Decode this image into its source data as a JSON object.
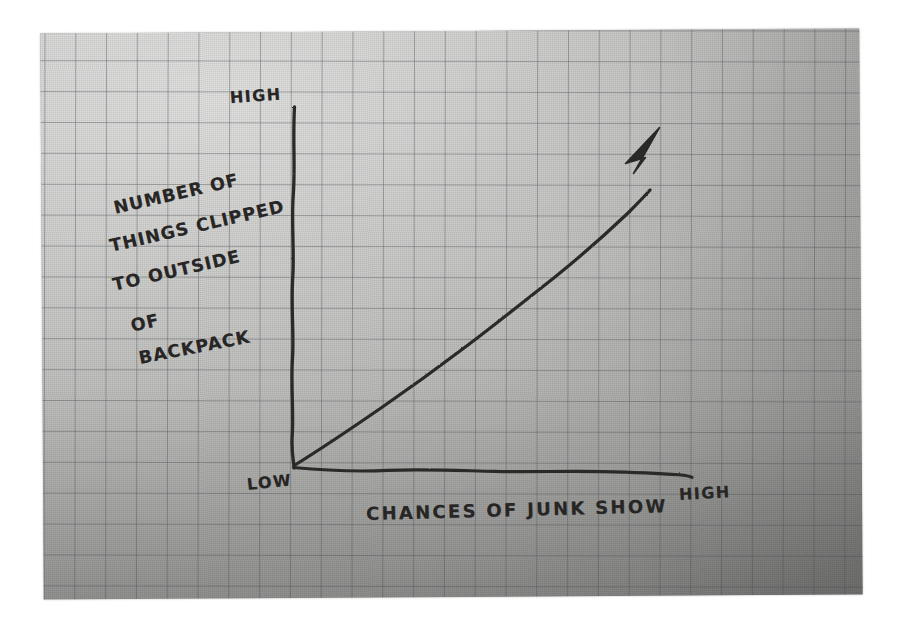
{
  "chart_data": {
    "type": "line",
    "title": "",
    "subtitle": "",
    "medium": "hand-drawn pen sketch on grey graph paper",
    "xlabel": "CHANCES OF JUNK SHOW",
    "ylabel": "NUMBER OF THINGS CLIPPED TO OUTSIDE OF BACKPACK",
    "ylabel_lines": [
      "NUMBER OF",
      "THINGS CLIPPED",
      "TO OUTSIDE",
      "OF",
      "BACKPACK"
    ],
    "x_tick_labels": [
      "LOW",
      "HIGH"
    ],
    "y_tick_labels": [
      "LOW",
      "HIGH"
    ],
    "origin_label": "LOW",
    "x_axis_end_label": "HIGH",
    "y_axis_top_label": "HIGH",
    "grid": true,
    "legend": false,
    "axes_are_qualitative": true,
    "xlim": [
      0,
      1
    ],
    "ylim": [
      0,
      1
    ],
    "series": [
      {
        "name": "trend",
        "style": "straight rising line with filled arrowhead",
        "arrowhead": true,
        "x": [
          0.0,
          0.12,
          0.25,
          0.38,
          0.5,
          0.62,
          0.75,
          0.88,
          1.0
        ],
        "y": [
          0.0,
          0.12,
          0.25,
          0.38,
          0.5,
          0.62,
          0.75,
          0.88,
          1.0
        ]
      }
    ],
    "annotations": [],
    "colors": {
      "ink": "#282624",
      "paper": "#bcbcba",
      "grid_line": "#5f6268",
      "background": "#ffffff"
    }
  },
  "ylabel_lines": [
    {
      "text": "NUMBER OF",
      "left": 114,
      "top": 200,
      "rotate": -13
    },
    {
      "text": "THINGS CLIPPED",
      "left": 110,
      "top": 238,
      "rotate": -13
    },
    {
      "text": "TO OUTSIDE",
      "left": 113,
      "top": 277,
      "rotate": -13
    },
    {
      "text": "OF",
      "left": 131,
      "top": 318,
      "rotate": -13
    },
    {
      "text": "BACKPACK",
      "left": 139,
      "top": 350,
      "rotate": -11
    }
  ],
  "axis_words": [
    {
      "name": "y-axis-high-label",
      "text": "HIGH",
      "left": 230,
      "top": 90,
      "rotate": -4
    },
    {
      "name": "x-axis-low-label",
      "text": "LOW",
      "left": 247,
      "top": 477,
      "rotate": -6
    },
    {
      "name": "x-axis-high-label",
      "text": "HIGH",
      "left": 679,
      "top": 487,
      "rotate": -3
    }
  ],
  "xlabel": {
    "text": "CHANCES OF JUNK SHOW",
    "left": 366,
    "top": 505,
    "rotate": -1.5
  }
}
